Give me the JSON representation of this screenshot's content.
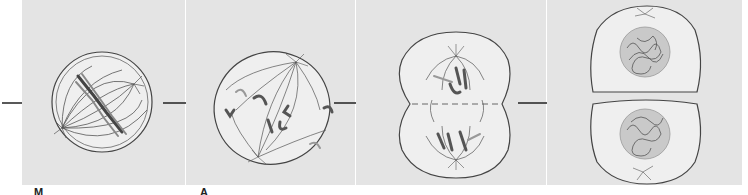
{
  "figure": {
    "title": "",
    "background_panel_color": "#e4e4e4",
    "cell_fill": "#efefef",
    "outline_color": "#444444",
    "chromosome_color": "#555555",
    "nucleus_color": "#c9c9c9",
    "stages": [
      {
        "id": "stage-1",
        "label_visible_fragment": "M",
        "depiction": "metaphase-cell-with-spindle-and-aligned-chromosomes"
      },
      {
        "id": "stage-2",
        "label_visible_fragment": "A",
        "depiction": "anaphase-cell-chromatids-separating"
      },
      {
        "id": "stage-3",
        "label_visible_fragment": "",
        "depiction": "telophase-cell-pinching-with-chromosomes-at-poles"
      },
      {
        "id": "stage-4",
        "label_visible_fragment": "",
        "depiction": "two-daughter-cells-with-nuclei"
      }
    ],
    "arrows": [
      "arrow-into-stage-1",
      "arrow-stage-1-to-2",
      "arrow-stage-2-to-3",
      "arrow-stage-3-to-4"
    ]
  }
}
